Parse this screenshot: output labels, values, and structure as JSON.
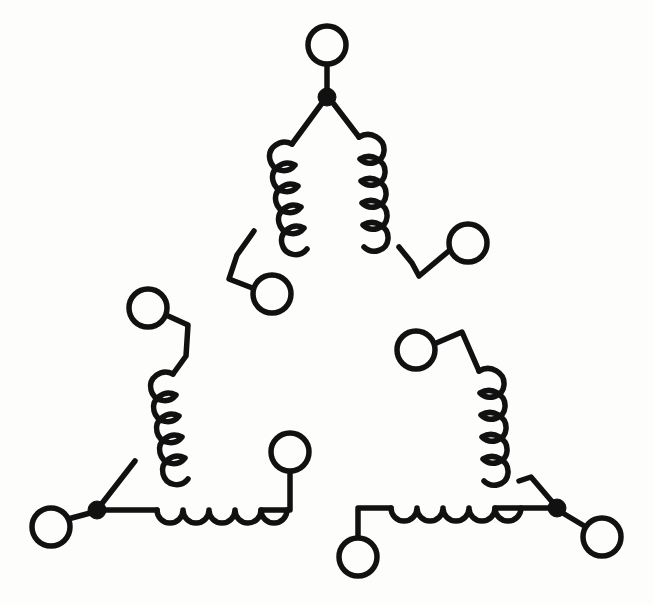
{
  "figure": {
    "title": "Three-phase delta-connected winding schematic",
    "background_color": "#fdfdfc",
    "ink_color": "#111111",
    "stroke_width": 5.5,
    "canvas": {
      "width": 653,
      "height": 605
    }
  },
  "geometry": {
    "terminal_radius": 19,
    "junction_radius": 9,
    "coil_turns_per_winding": 5
  },
  "junctions": [
    {
      "name": "top-junction",
      "x": 327,
      "y": 97,
      "label": "top"
    },
    {
      "name": "bottom-left-junction",
      "x": 97,
      "y": 510,
      "label": "bottom-left"
    },
    {
      "name": "bottom-right-junction",
      "x": 557,
      "y": 508,
      "label": "bottom-right"
    }
  ],
  "terminals": [
    {
      "name": "terminal-top",
      "x": 327,
      "y": 45,
      "cx": 327,
      "cy": 45
    },
    {
      "name": "terminal-upper-left-winding",
      "x": 272,
      "y": 294,
      "cx": 272,
      "cy": 294
    },
    {
      "name": "terminal-upper-right-winding",
      "x": 468,
      "y": 243,
      "cx": 468,
      "cy": 243
    },
    {
      "name": "terminal-left-upper",
      "x": 148,
      "y": 308,
      "cx": 148,
      "cy": 308
    },
    {
      "name": "terminal-left-lower",
      "x": 51,
      "y": 527,
      "cx": 51,
      "cy": 527
    },
    {
      "name": "terminal-bottom-mid-left",
      "x": 290,
      "y": 452,
      "cx": 290,
      "cy": 452
    },
    {
      "name": "terminal-bottom-mid-right",
      "x": 358,
      "y": 557,
      "cx": 358,
      "cy": 557
    },
    {
      "name": "terminal-right-upper",
      "x": 416,
      "y": 350,
      "cx": 416,
      "cy": 350
    },
    {
      "name": "terminal-right-lower",
      "x": 602,
      "y": 537,
      "cx": 602,
      "cy": 537
    }
  ],
  "windings": [
    {
      "name": "winding-top-left",
      "orientation": "diagonal-down-left",
      "turns": 5,
      "start": {
        "x": 327,
        "y": 97
      },
      "end": {
        "x": 272,
        "y": 294
      }
    },
    {
      "name": "winding-top-right",
      "orientation": "diagonal-down-right",
      "turns": 5,
      "start": {
        "x": 327,
        "y": 97
      },
      "end": {
        "x": 468,
        "y": 243
      }
    },
    {
      "name": "winding-left",
      "orientation": "diagonal-down-left",
      "turns": 5,
      "start": {
        "x": 148,
        "y": 308
      },
      "end": {
        "x": 97,
        "y": 510
      }
    },
    {
      "name": "winding-bottom-left",
      "orientation": "horizontal",
      "turns": 5,
      "start": {
        "x": 97,
        "y": 510
      },
      "end": {
        "x": 290,
        "y": 452
      }
    },
    {
      "name": "winding-right",
      "orientation": "diagonal-down-right",
      "turns": 5,
      "start": {
        "x": 416,
        "y": 350
      },
      "end": {
        "x": 557,
        "y": 508
      }
    },
    {
      "name": "winding-bottom-right",
      "orientation": "horizontal",
      "turns": 5,
      "start": {
        "x": 358,
        "y": 557
      },
      "end": {
        "x": 557,
        "y": 508
      }
    }
  ],
  "labels": {
    "none_visible": ""
  }
}
